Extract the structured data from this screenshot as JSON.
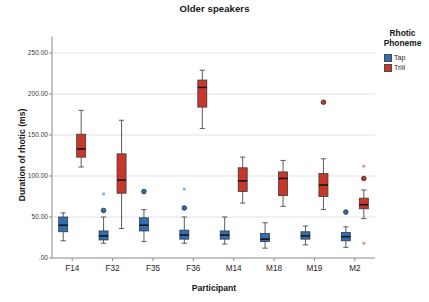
{
  "chart_data": {
    "type": "box",
    "title": "Older speakers",
    "xlabel": "Participant",
    "ylabel": "Duration of rhotic (ms)",
    "categories": [
      "F14",
      "F32",
      "F35",
      "F36",
      "M14",
      "M18",
      "M19",
      "M2"
    ],
    "ylim": [
      0,
      270
    ],
    "yticks": [
      0,
      50,
      100,
      150,
      200,
      250
    ],
    "ytick_labels": [
      ".00",
      "50.00",
      "100.00",
      "150.00",
      "200.00",
      "250.00"
    ],
    "grid": "horizontal",
    "legend": {
      "title_line1": "Rhotic",
      "title_line2": "Phoneme",
      "position": "right",
      "entries": [
        {
          "label": "Tap",
          "color": "#2f6fb5"
        },
        {
          "label": "Trill",
          "color": "#c7372a"
        }
      ]
    },
    "series": [
      {
        "name": "Tap",
        "color": "#2f6fb5",
        "boxes": [
          {
            "category": "F14",
            "whisker_low": 21,
            "q1": 32,
            "median": 40,
            "q3": 50,
            "whisker_high": 55,
            "outliers": [],
            "extremes": []
          },
          {
            "category": "F32",
            "whisker_low": 18,
            "q1": 22,
            "median": 27,
            "q3": 33,
            "whisker_high": 50,
            "outliers": [
              58
            ],
            "extremes": [
              78
            ]
          },
          {
            "category": "F35",
            "whisker_low": 20,
            "q1": 33,
            "median": 40,
            "q3": 49,
            "whisker_high": 59,
            "outliers": [
              81
            ],
            "extremes": []
          },
          {
            "category": "F36",
            "whisker_low": 18,
            "q1": 23,
            "median": 28,
            "q3": 34,
            "whisker_high": 50,
            "outliers": [
              61
            ],
            "extremes": [
              84
            ]
          },
          {
            "category": "M14",
            "whisker_low": 17,
            "q1": 23,
            "median": 28,
            "q3": 33,
            "whisker_high": 50,
            "outliers": [],
            "extremes": []
          },
          {
            "category": "M18",
            "whisker_low": 12,
            "q1": 20,
            "median": 23,
            "q3": 30,
            "whisker_high": 43,
            "outliers": [],
            "extremes": []
          },
          {
            "category": "M19",
            "whisker_low": 16,
            "q1": 23,
            "median": 27,
            "q3": 32,
            "whisker_high": 39,
            "outliers": [],
            "extremes": []
          },
          {
            "category": "M2",
            "whisker_low": 13,
            "q1": 21,
            "median": 26,
            "q3": 31,
            "whisker_high": 38,
            "outliers": [
              56
            ],
            "extremes": []
          }
        ]
      },
      {
        "name": "Trill",
        "color": "#c7372a",
        "boxes": [
          {
            "category": "F14",
            "whisker_low": 111,
            "q1": 123,
            "median": 133,
            "q3": 151,
            "whisker_high": 180,
            "outliers": [],
            "extremes": []
          },
          {
            "category": "F32",
            "whisker_low": 36,
            "q1": 79,
            "median": 95,
            "q3": 127,
            "whisker_high": 168,
            "outliers": [],
            "extremes": []
          },
          {
            "category": "F36",
            "whisker_low": 158,
            "q1": 184,
            "median": 208,
            "q3": 217,
            "whisker_high": 229,
            "outliers": [],
            "extremes": []
          },
          {
            "category": "M14",
            "whisker_low": 67,
            "q1": 81,
            "median": 94,
            "q3": 110,
            "whisker_high": 123,
            "outliers": [],
            "extremes": []
          },
          {
            "category": "M18",
            "whisker_low": 63,
            "q1": 76,
            "median": 97,
            "q3": 105,
            "whisker_high": 119,
            "outliers": [],
            "extremes": []
          },
          {
            "category": "M19",
            "whisker_low": 59,
            "q1": 75,
            "median": 89,
            "q3": 103,
            "whisker_high": 121,
            "outliers": [
              190
            ],
            "extremes": []
          },
          {
            "category": "M2",
            "whisker_low": 48,
            "q1": 60,
            "median": 65,
            "q3": 73,
            "whisker_high": 83,
            "outliers": [
              97
            ],
            "extremes": [
              112,
              18
            ]
          }
        ]
      }
    ]
  }
}
